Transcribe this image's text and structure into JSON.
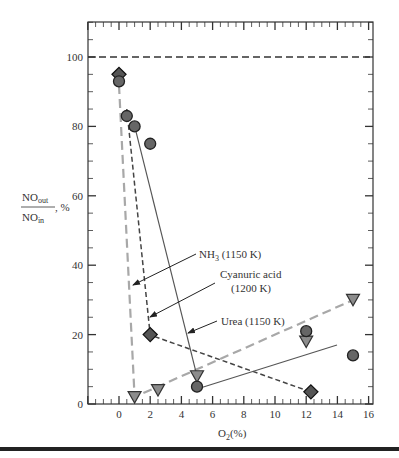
{
  "chart_data": {
    "type": "scatter",
    "title": "",
    "xlabel": "O2(%)",
    "ylabel": "NOout/NOin, %",
    "xlim": [
      -2,
      16
    ],
    "ylim": [
      0,
      110
    ],
    "x_ticks": [
      0,
      2,
      4,
      6,
      8,
      10,
      12,
      14,
      16
    ],
    "y_ticks": [
      0,
      20,
      40,
      60,
      80,
      100
    ],
    "grid": false,
    "reference_line": {
      "y": 100,
      "style": "dashed"
    },
    "series": [
      {
        "name": "NH3 (1150 K)",
        "marker": "triangle-down",
        "color": "#8c8c8c",
        "line": "long-dashed light gray",
        "points": [
          [
            1,
            2
          ],
          [
            2.5,
            4
          ],
          [
            5,
            8
          ],
          [
            12,
            18
          ],
          [
            15,
            30
          ]
        ],
        "line_path": [
          [
            0,
            92
          ],
          [
            1,
            2
          ],
          [
            15,
            30
          ]
        ]
      },
      {
        "name": "Cyanuric acid (1200 K)",
        "marker": "diamond",
        "color": "#555555",
        "line": "short-dashed dark gray",
        "points": [
          [
            0,
            95
          ],
          [
            2,
            20
          ],
          [
            12.3,
            3.5
          ]
        ],
        "line_path": [
          [
            0.5,
            85
          ],
          [
            2,
            20
          ],
          [
            12.3,
            3.5
          ]
        ]
      },
      {
        "name": "Urea (1150 K)",
        "marker": "circle",
        "color": "#666666",
        "line": "solid gray",
        "points": [
          [
            0,
            93
          ],
          [
            0.5,
            83
          ],
          [
            1,
            80
          ],
          [
            2,
            75
          ],
          [
            5,
            5
          ],
          [
            12,
            21
          ],
          [
            15,
            14
          ]
        ],
        "line_path": [
          [
            1,
            80
          ],
          [
            5,
            8
          ],
          [
            5,
            5
          ],
          [
            14,
            17
          ]
        ]
      }
    ],
    "annotations": [
      {
        "text": "NH3 (1150 K)",
        "arrow_to": [
          0.8,
          33
        ]
      },
      {
        "text": "Cyanuric acid (1200 K)",
        "arrow_to": [
          1.9,
          24
        ]
      },
      {
        "text": "Urea (1150 K)",
        "arrow_to": [
          4.3,
          20
        ]
      }
    ]
  },
  "axis": {
    "x_label_main": "O",
    "x_label_sub": "2",
    "x_label_tail": "(%)",
    "y_label_num": "NO",
    "y_label_num_sub": "out",
    "y_label_den": "NO",
    "y_label_den_sub": "in",
    "y_label_tail": ", %",
    "x_tick_labels": [
      "0",
      "2",
      "4",
      "6",
      "8",
      "10",
      "12",
      "14",
      "16"
    ],
    "y_tick_labels": [
      "0",
      "20",
      "40",
      "60",
      "80",
      "100"
    ]
  },
  "labels": {
    "nh3": "NH",
    "nh3_sub": "3",
    "nh3_tail": " (1150 K)",
    "cyanuric_line1": "Cyanuric acid",
    "cyanuric_line2": "(1200 K)",
    "urea": "Urea (1150 K)"
  }
}
